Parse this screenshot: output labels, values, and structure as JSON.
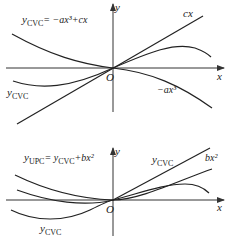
{
  "diagrams": [
    {
      "id": "top",
      "axis_labels": {
        "x": "x",
        "y": "y",
        "origin": "O"
      },
      "formula": {
        "lhs": "y",
        "lhs_sub": "CVC",
        "rhs": "= −ax³+cx"
      },
      "curve_labels": {
        "linear": "cx",
        "cubic": "−ax³",
        "sum_main": "y",
        "sum_sub": "CVC"
      }
    },
    {
      "id": "bottom",
      "axis_labels": {
        "x": "x",
        "y": "y",
        "origin": "O"
      },
      "formula": {
        "lhs": "y",
        "lhs_sub": "UPC",
        "mid": "= y",
        "mid_sub": "CVC",
        "rhs": "+bx²"
      },
      "curve_labels": {
        "cvc_main": "y",
        "cvc_sub": "CVC",
        "quadratic": "bx²",
        "lower_main": "y",
        "lower_sub": "CVC"
      }
    }
  ]
}
